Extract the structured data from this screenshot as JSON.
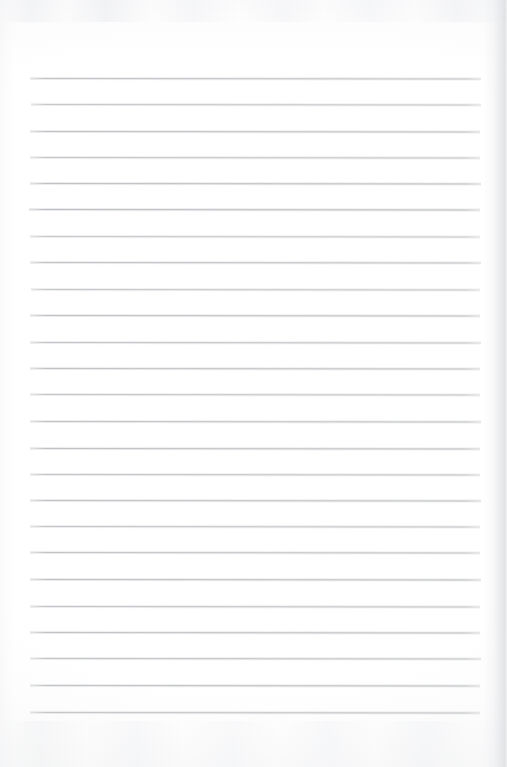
{
  "document": {
    "kind": "scanned-page",
    "title": "Blank ruled notebook page",
    "page_width": 507,
    "page_height": 767,
    "written_text": "",
    "headings": [],
    "annotations": [],
    "page_number": "",
    "colors": {
      "paper": "#fefefe",
      "rule_line": "#b9babd",
      "edge_shadow": "#cfd1d6"
    }
  },
  "ruling": {
    "line_count": 25,
    "line_thickness_px": 1,
    "line_spacing_px": 26.4,
    "left_margin_px": 30,
    "right_margin_px": 480,
    "first_line_y_px": 78,
    "last_line_y_px": 712,
    "top_blank_height_px": 78,
    "bottom_blank_height_px": 55,
    "vertical_margin_rule": false,
    "lines": [
      {
        "y": 78,
        "x1": 30,
        "x2": 481,
        "opacity": 0.88,
        "tilt": 0.06
      },
      {
        "y": 104,
        "x1": 31,
        "x2": 481,
        "opacity": 0.82,
        "tilt": 0.05
      },
      {
        "y": 131,
        "x1": 30,
        "x2": 480,
        "opacity": 0.9,
        "tilt": 0.05
      },
      {
        "y": 157,
        "x1": 30,
        "x2": 480,
        "opacity": 0.84,
        "tilt": 0.06
      },
      {
        "y": 183,
        "x1": 30,
        "x2": 481,
        "opacity": 0.92,
        "tilt": 0.05
      },
      {
        "y": 209,
        "x1": 29,
        "x2": 480,
        "opacity": 0.95,
        "tilt": 0.05
      },
      {
        "y": 236,
        "x1": 30,
        "x2": 480,
        "opacity": 0.8,
        "tilt": 0.06
      },
      {
        "y": 262,
        "x1": 30,
        "x2": 481,
        "opacity": 0.88,
        "tilt": 0.05
      },
      {
        "y": 289,
        "x1": 31,
        "x2": 480,
        "opacity": 0.82,
        "tilt": 0.05
      },
      {
        "y": 315,
        "x1": 30,
        "x2": 480,
        "opacity": 0.9,
        "tilt": 0.06
      },
      {
        "y": 342,
        "x1": 30,
        "x2": 481,
        "opacity": 0.86,
        "tilt": 0.05
      },
      {
        "y": 368,
        "x1": 30,
        "x2": 480,
        "opacity": 0.9,
        "tilt": 0.05
      },
      {
        "y": 394,
        "x1": 30,
        "x2": 480,
        "opacity": 0.84,
        "tilt": 0.06
      },
      {
        "y": 421,
        "x1": 30,
        "x2": 481,
        "opacity": 0.88,
        "tilt": 0.05
      },
      {
        "y": 448,
        "x1": 30,
        "x2": 480,
        "opacity": 0.92,
        "tilt": 0.05
      },
      {
        "y": 474,
        "x1": 30,
        "x2": 480,
        "opacity": 0.86,
        "tilt": 0.06
      },
      {
        "y": 500,
        "x1": 30,
        "x2": 481,
        "opacity": 0.9,
        "tilt": 0.05
      },
      {
        "y": 526,
        "x1": 30,
        "x2": 480,
        "opacity": 0.84,
        "tilt": 0.05
      },
      {
        "y": 552,
        "x1": 30,
        "x2": 480,
        "opacity": 0.88,
        "tilt": 0.06
      },
      {
        "y": 579,
        "x1": 30,
        "x2": 481,
        "opacity": 0.92,
        "tilt": 0.05
      },
      {
        "y": 606,
        "x1": 30,
        "x2": 480,
        "opacity": 0.86,
        "tilt": 0.05
      },
      {
        "y": 632,
        "x1": 30,
        "x2": 480,
        "opacity": 0.9,
        "tilt": 0.06
      },
      {
        "y": 658,
        "x1": 30,
        "x2": 481,
        "opacity": 0.88,
        "tilt": 0.05
      },
      {
        "y": 685,
        "x1": 30,
        "x2": 480,
        "opacity": 0.92,
        "tilt": 0.05
      },
      {
        "y": 712,
        "x1": 30,
        "x2": 480,
        "opacity": 0.9,
        "tilt": 0.05
      }
    ]
  }
}
